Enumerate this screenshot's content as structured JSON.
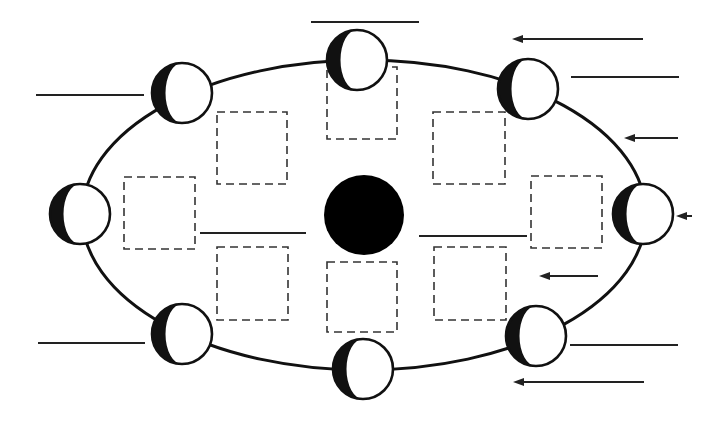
{
  "diagram": {
    "type": "moon-phases-worksheet",
    "colors": {
      "background": "#ffffff",
      "ink": "#111111",
      "dash": "#333333",
      "line": "#222222"
    },
    "orbit": {
      "cx": 364,
      "cy": 215,
      "rx": 282,
      "ry": 155
    },
    "earth": {
      "cx": 364,
      "cy": 215,
      "r": 40,
      "fill": "#000000"
    },
    "moons": [
      {
        "id": "moon-top",
        "cx": 357,
        "cy": 60,
        "r": 30
      },
      {
        "id": "moon-top-right",
        "cx": 528,
        "cy": 89,
        "r": 30
      },
      {
        "id": "moon-right",
        "cx": 643,
        "cy": 214,
        "r": 30
      },
      {
        "id": "moon-bottom-right",
        "cx": 536,
        "cy": 336,
        "r": 30
      },
      {
        "id": "moon-bottom",
        "cx": 363,
        "cy": 369,
        "r": 30
      },
      {
        "id": "moon-bottom-left",
        "cx": 182,
        "cy": 334,
        "r": 30
      },
      {
        "id": "moon-left",
        "cx": 80,
        "cy": 214,
        "r": 30
      },
      {
        "id": "moon-top-left",
        "cx": 182,
        "cy": 93,
        "r": 30
      }
    ],
    "label_boxes": [
      {
        "id": "box-top",
        "x": 327,
        "y": 67,
        "w": 70,
        "h": 72
      },
      {
        "id": "box-top-left",
        "x": 217,
        "y": 112,
        "w": 70,
        "h": 72
      },
      {
        "id": "box-top-right",
        "x": 433,
        "y": 112,
        "w": 72,
        "h": 72
      },
      {
        "id": "box-left",
        "x": 124,
        "y": 177,
        "w": 71,
        "h": 72
      },
      {
        "id": "box-right",
        "x": 531,
        "y": 176,
        "w": 71,
        "h": 72
      },
      {
        "id": "box-bottom-left",
        "x": 217,
        "y": 247,
        "w": 71,
        "h": 73
      },
      {
        "id": "box-bottom-right",
        "x": 434,
        "y": 247,
        "w": 72,
        "h": 73
      },
      {
        "id": "box-bottom",
        "x": 327,
        "y": 262,
        "w": 70,
        "h": 70
      }
    ],
    "answer_lines": [
      {
        "id": "line-top",
        "x1": 311,
        "y1": 22,
        "x2": 419,
        "y2": 22
      },
      {
        "id": "line-top-left",
        "x1": 36,
        "y1": 95,
        "x2": 144,
        "y2": 95
      },
      {
        "id": "line-top-right",
        "x1": 571,
        "y1": 77,
        "x2": 679,
        "y2": 77
      },
      {
        "id": "line-center-left",
        "x1": 200,
        "y1": 233,
        "x2": 306,
        "y2": 233
      },
      {
        "id": "line-center-right",
        "x1": 419,
        "y1": 236,
        "x2": 527,
        "y2": 236
      },
      {
        "id": "line-bottom-left",
        "x1": 38,
        "y1": 343,
        "x2": 145,
        "y2": 343
      },
      {
        "id": "line-bottom-right",
        "x1": 570,
        "y1": 345,
        "x2": 678,
        "y2": 345
      }
    ],
    "sunlight_arrows": [
      {
        "id": "arrow-1",
        "x1": 643,
        "y1": 39,
        "x2": 512,
        "y2": 39
      },
      {
        "id": "arrow-2",
        "x1": 678,
        "y1": 138,
        "x2": 624,
        "y2": 138
      },
      {
        "id": "arrow-3",
        "x1": 692,
        "y1": 216,
        "x2": 676,
        "y2": 216
      },
      {
        "id": "arrow-4",
        "x1": 598,
        "y1": 276,
        "x2": 539,
        "y2": 276
      },
      {
        "id": "arrow-5",
        "x1": 644,
        "y1": 382,
        "x2": 513,
        "y2": 382
      }
    ]
  }
}
